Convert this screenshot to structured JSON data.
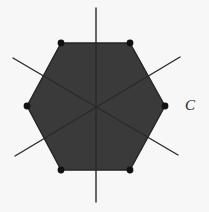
{
  "figure": {
    "name": "regular-hexagon-with-three-diagonals",
    "background_color": "#f7f7f7",
    "canvas": {
      "width": 209,
      "height": 212
    },
    "label": {
      "text": "C",
      "x": 190,
      "y": 107,
      "style": "italic-serif",
      "color": "#1c1c1c"
    },
    "polygon": {
      "kind": "hexagon",
      "sides": 6,
      "orientation": "flat-top",
      "fill_color": "#3a3a3a",
      "stroke_color": "#242424",
      "stroke_width": 1.4,
      "center": {
        "x": 96,
        "y": 107
      },
      "radius_x": 70,
      "radius_y": 64,
      "vertices": [
        {
          "name": "top-left",
          "x": 61,
          "y": 43
        },
        {
          "name": "top-right",
          "x": 130,
          "y": 43
        },
        {
          "name": "right",
          "x": 165,
          "y": 106
        },
        {
          "name": "bottom-right",
          "x": 130,
          "y": 170
        },
        {
          "name": "bottom-left",
          "x": 61,
          "y": 170
        },
        {
          "name": "left",
          "x": 27,
          "y": 106
        }
      ]
    },
    "vertex_markers": {
      "shape": "circle",
      "radius": 3.4,
      "color": "#111111",
      "count": 6
    },
    "diagonals": {
      "color": "#2a2a2a",
      "width": 1.4,
      "count": 3,
      "lines": [
        {
          "name": "vertical-axis",
          "x1": 96,
          "y1": 8,
          "x2": 96,
          "y2": 202
        },
        {
          "name": "diagonal-nw-se",
          "x1": 13,
          "y1": 58,
          "x2": 178,
          "y2": 155
        },
        {
          "name": "diagonal-sw-ne",
          "x1": 15,
          "y1": 156,
          "x2": 180,
          "y2": 57
        }
      ]
    }
  }
}
